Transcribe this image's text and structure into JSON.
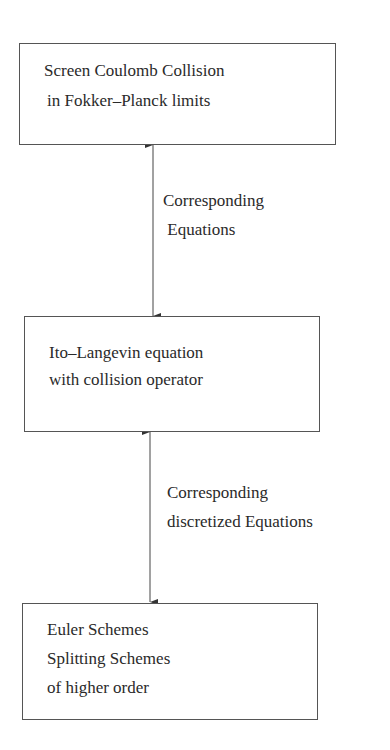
{
  "diagram": {
    "boxes": [
      {
        "lines": [
          "Screen Coulomb Collision",
          "in Fokker–Planck limits"
        ]
      },
      {
        "lines": [
          "Ito–Langevin equation",
          "with collision operator"
        ]
      },
      {
        "lines": [
          "Euler Schemes",
          "Splitting Schemes",
          "of higher order"
        ]
      }
    ],
    "edges": [
      {
        "from": 0,
        "to": 1,
        "direction": "bidirectional",
        "label_lines": [
          "Corresponding",
          " Equations"
        ]
      },
      {
        "from": 1,
        "to": 2,
        "direction": "bidirectional",
        "label_lines": [
          "Corresponding",
          "discretized Equations"
        ]
      }
    ]
  }
}
